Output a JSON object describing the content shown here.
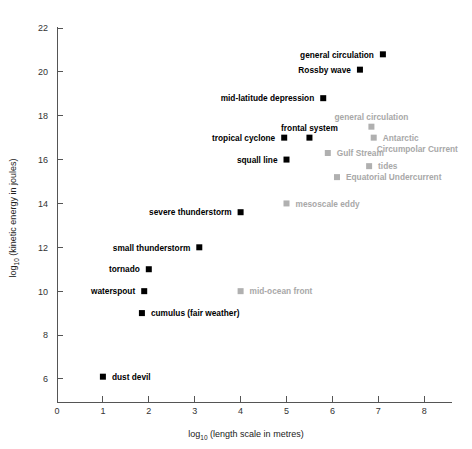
{
  "chart_data": {
    "type": "scatter",
    "title": "",
    "xlabel": "log10 (length scale in metres)",
    "ylabel": "log10 (kinetic energy in joules)",
    "xlabel_prefix": "log",
    "xlabel_sub": "10",
    "xlabel_rest": " (length scale in metres)",
    "ylabel_prefix": "log",
    "ylabel_sub": "10",
    "ylabel_rest": " (kinetic energy in joules)",
    "xlim": [
      0,
      8.6
    ],
    "ylim": [
      5.2,
      22.4
    ],
    "xticks": [
      0,
      1,
      2,
      3,
      4,
      5,
      6,
      7,
      8
    ],
    "yticks": [
      6,
      8,
      10,
      12,
      14,
      16,
      18,
      20,
      22
    ],
    "grid": false,
    "legend": "none",
    "colors": {
      "atmospheric": "#000000",
      "oceanic": "#b0b0b0",
      "axis": "#555555"
    },
    "series": [
      {
        "name": "atmospheric phenomena",
        "color": "#000000",
        "points": [
          {
            "label": "general circulation",
            "x": 7.1,
            "y": 20.8,
            "label_side": "left"
          },
          {
            "label": "Rossby wave",
            "x": 6.6,
            "y": 20.1,
            "label_side": "left"
          },
          {
            "label": "mid-latitude depression",
            "x": 5.8,
            "y": 18.8,
            "label_side": "left"
          },
          {
            "label": "frontal system",
            "x": 5.5,
            "y": 17.0,
            "label_side": "above"
          },
          {
            "label": "tropical cyclone",
            "x": 4.95,
            "y": 17.0,
            "label_side": "left"
          },
          {
            "label": "squall line",
            "x": 5.0,
            "y": 16.0,
            "label_side": "left"
          },
          {
            "label": "severe thunderstorm",
            "x": 4.0,
            "y": 13.6,
            "label_side": "left"
          },
          {
            "label": "small thunderstorm",
            "x": 3.1,
            "y": 12.0,
            "label_side": "left"
          },
          {
            "label": "tornado",
            "x": 2.0,
            "y": 11.0,
            "label_side": "left"
          },
          {
            "label": "waterspout",
            "x": 1.9,
            "y": 10.0,
            "label_side": "left"
          },
          {
            "label": "cumulus (fair weather)",
            "x": 1.85,
            "y": 9.0,
            "label_side": "right"
          },
          {
            "label": "dust devil",
            "x": 1.0,
            "y": 6.1,
            "label_side": "right"
          }
        ]
      },
      {
        "name": "oceanic phenomena",
        "color": "#b0b0b0",
        "points": [
          {
            "label": "general circulation",
            "x": 6.85,
            "y": 17.5,
            "label_side": "above"
          },
          {
            "label": "Antarctic Circumpolar Current",
            "x": 6.9,
            "y": 17.0,
            "label_side": "right2"
          },
          {
            "label": "Gulf Stream",
            "x": 5.9,
            "y": 16.3,
            "label_side": "right"
          },
          {
            "label": "tides",
            "x": 6.8,
            "y": 15.7,
            "label_side": "right"
          },
          {
            "label": "Equatorial Undercurrent",
            "x": 6.1,
            "y": 15.2,
            "label_side": "right"
          },
          {
            "label": "mesoscale eddy",
            "x": 5.0,
            "y": 14.0,
            "label_side": "right"
          },
          {
            "label": "mid-ocean front",
            "x": 4.0,
            "y": 10.0,
            "label_side": "right"
          }
        ]
      }
    ]
  },
  "axis": {
    "x_tick_labels": [
      "0",
      "1",
      "2",
      "3",
      "4",
      "5",
      "6",
      "7",
      "8"
    ],
    "y_tick_labels": [
      "6",
      "8",
      "10",
      "12",
      "14",
      "16",
      "18",
      "20",
      "22"
    ]
  }
}
